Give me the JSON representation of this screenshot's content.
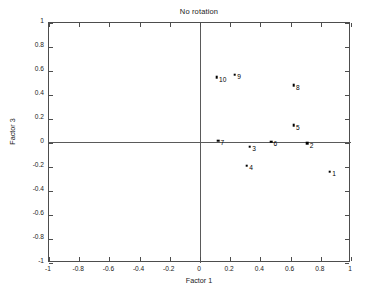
{
  "chart_data": {
    "type": "scatter",
    "title": "No rotation",
    "xlabel": "Factor 1",
    "ylabel": "Factor 3",
    "xlim": [
      -1,
      1
    ],
    "ylim": [
      -1,
      1
    ],
    "grid": false,
    "legend": null,
    "xticks": [
      "-1",
      "-0.8",
      "-0.6",
      "-0.4",
      "-0.2",
      "0",
      "0.2",
      "0.4",
      "0.6",
      "0.8",
      "1"
    ],
    "xtickvalues": [
      -1,
      -0.8,
      -0.6,
      -0.4,
      -0.2,
      0,
      0.2,
      0.4,
      0.6,
      0.8,
      1
    ],
    "yticks": [
      "1",
      "0.8",
      "0.6",
      "0.4",
      "0.2",
      "0",
      "-0.2",
      "-0.4",
      "-0.6",
      "-0.8",
      "-1"
    ],
    "ytickvalues": [
      1,
      0.8,
      0.6,
      0.4,
      0.2,
      0,
      -0.2,
      -0.4,
      -0.6,
      -0.8,
      -1
    ],
    "annotations": [
      "origin reference lines at x=0 and y=0"
    ],
    "points": [
      {
        "label": "1",
        "x": 0.86,
        "y": -0.24
      },
      {
        "label": "2",
        "x": 0.71,
        "y": 0.0
      },
      {
        "label": "3",
        "x": 0.33,
        "y": -0.03
      },
      {
        "label": "4",
        "x": 0.31,
        "y": -0.19
      },
      {
        "label": "5",
        "x": 0.62,
        "y": 0.15
      },
      {
        "label": "6",
        "x": 0.47,
        "y": 0.01
      },
      {
        "label": "7",
        "x": 0.12,
        "y": 0.02
      },
      {
        "label": "8",
        "x": 0.62,
        "y": 0.48
      },
      {
        "label": "9",
        "x": 0.23,
        "y": 0.57
      },
      {
        "label": "10",
        "x": 0.11,
        "y": 0.55
      }
    ]
  },
  "figure": {
    "background_color": "#ffffff",
    "axis_color": "#4d4d4d",
    "marker_color": "#000000",
    "text_color": "#1a1a1a"
  }
}
